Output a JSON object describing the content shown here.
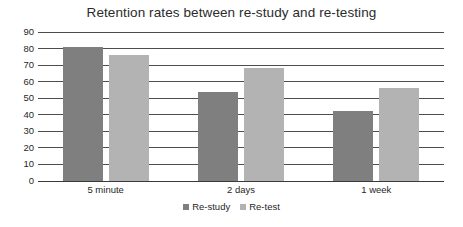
{
  "chart_data": {
    "type": "bar",
    "title": "Retention rates between re-study and re-testing",
    "xlabel": "",
    "ylabel": "",
    "categories": [
      "5 minute",
      "2 days",
      "1 week"
    ],
    "series": [
      {
        "name": "Re-study",
        "values": [
          81,
          54,
          42
        ],
        "color": "#7f7f7f"
      },
      {
        "name": "Re-test",
        "values": [
          76,
          68,
          56
        ],
        "color": "#b3b3b3"
      }
    ],
    "ylim": [
      0,
      90
    ],
    "y_ticks": [
      0,
      10,
      20,
      30,
      40,
      50,
      60,
      70,
      80,
      90
    ],
    "y_tick_labels": [
      "0",
      "10",
      "20",
      "30",
      "40",
      "50",
      "60",
      "70",
      "80",
      "90"
    ],
    "grid": true,
    "grid_axis": "y",
    "legend_position": "bottom",
    "background_color": "#ffffff",
    "grid_color": "#4d4d4d",
    "text_color": "#1f1f1f"
  }
}
